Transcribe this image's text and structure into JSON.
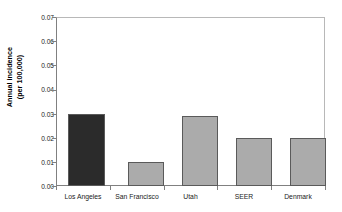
{
  "chart_data": {
    "type": "bar",
    "title": "",
    "xlabel": "",
    "ylabel": "Annual incidence (per 100,000)",
    "ylabel_lines": [
      "Annual incidence",
      "(per 100,000)"
    ],
    "categories": [
      "Los Angeles",
      "San Francisco",
      "Utah",
      "SEER",
      "Denmark"
    ],
    "values": [
      0.03,
      0.01,
      0.029,
      0.02,
      0.02
    ],
    "ylim": [
      0.0,
      0.07
    ],
    "ytick_labels": [
      "0.07",
      "0.06",
      "0.05",
      "0.04",
      "0.03",
      "0.02",
      "0.01",
      "0.00"
    ],
    "ytick_values": [
      0.07,
      0.06,
      0.05,
      0.04,
      0.03,
      0.02,
      0.01,
      0.0
    ],
    "grid": false,
    "legend": "none",
    "bar_colors": [
      "#2b2b2b",
      "#ababab",
      "#ababab",
      "#ababab",
      "#ababab"
    ],
    "bar_edge_color": "#5a5a5a",
    "highlight_category": "Los Angeles",
    "background": "#ffffff"
  }
}
